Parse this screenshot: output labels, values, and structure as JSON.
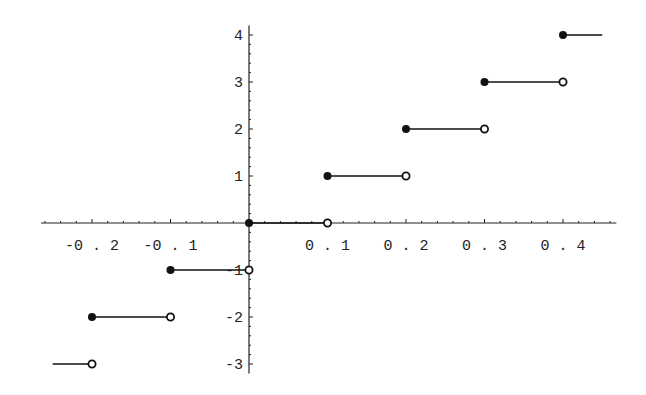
{
  "chart_data": {
    "type": "line",
    "subtype": "step-function (floor)",
    "title": "",
    "xlabel": "",
    "ylabel": "",
    "xlim": [
      -0.25,
      0.45
    ],
    "ylim": [
      -3,
      4
    ],
    "grid": false,
    "legend": null,
    "x_ticks": [
      "-0.2",
      "-0.1",
      "0.1",
      "0.2",
      "0.3",
      "0.4"
    ],
    "x_tick_values": [
      -0.2,
      -0.1,
      0.1,
      0.2,
      0.3,
      0.4
    ],
    "y_ticks": [
      "-3",
      "-2",
      "-1",
      "1",
      "2",
      "3",
      "4"
    ],
    "y_tick_values": [
      -3,
      -2,
      -1,
      1,
      2,
      3,
      4
    ],
    "segments": [
      {
        "x_start": -0.25,
        "x_end": -0.2,
        "y": -3,
        "start_closed": null,
        "end_open": true
      },
      {
        "x_start": -0.2,
        "x_end": -0.1,
        "y": -2,
        "start_closed": true,
        "end_open": true
      },
      {
        "x_start": -0.1,
        "x_end": 0.0,
        "y": -1,
        "start_closed": true,
        "end_open": true
      },
      {
        "x_start": 0.0,
        "x_end": 0.1,
        "y": 0,
        "start_closed": true,
        "end_open": true
      },
      {
        "x_start": 0.1,
        "x_end": 0.2,
        "y": 1,
        "start_closed": true,
        "end_open": true
      },
      {
        "x_start": 0.2,
        "x_end": 0.3,
        "y": 2,
        "start_closed": true,
        "end_open": true
      },
      {
        "x_start": 0.3,
        "x_end": 0.4,
        "y": 3,
        "start_closed": true,
        "end_open": true
      },
      {
        "x_start": 0.4,
        "x_end": 0.45,
        "y": 4,
        "start_closed": true,
        "end_open": null
      }
    ]
  }
}
